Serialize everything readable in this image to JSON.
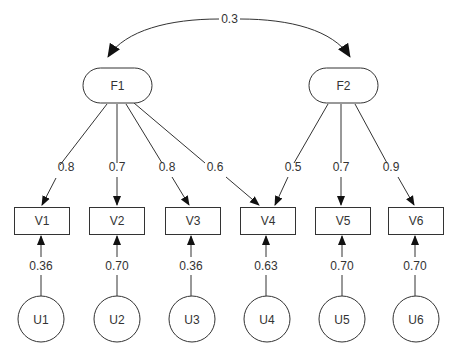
{
  "diagram": {
    "type": "structural-equation-model",
    "factors": [
      {
        "id": "F1",
        "label": "F1"
      },
      {
        "id": "F2",
        "label": "F2"
      }
    ],
    "factor_correlation": {
      "from": "F1",
      "to": "F2",
      "label": "0.3"
    },
    "variables": [
      {
        "id": "V1",
        "label": "V1"
      },
      {
        "id": "V2",
        "label": "V2"
      },
      {
        "id": "V3",
        "label": "V3"
      },
      {
        "id": "V4",
        "label": "V4"
      },
      {
        "id": "V5",
        "label": "V5"
      },
      {
        "id": "V6",
        "label": "V6"
      }
    ],
    "loadings": [
      {
        "from": "F1",
        "to": "V1",
        "label": "0.8"
      },
      {
        "from": "F1",
        "to": "V2",
        "label": "0.7"
      },
      {
        "from": "F1",
        "to": "V3",
        "label": "0.8"
      },
      {
        "from": "F1",
        "to": "V4",
        "label": "0.6"
      },
      {
        "from": "F2",
        "to": "V4",
        "label": "0.5"
      },
      {
        "from": "F2",
        "to": "V5",
        "label": "0.7"
      },
      {
        "from": "F2",
        "to": "V6",
        "label": "0.9"
      }
    ],
    "uniquenesses": [
      {
        "id": "U1",
        "label": "U1",
        "to": "V1",
        "value": "0.36"
      },
      {
        "id": "U2",
        "label": "U2",
        "to": "V2",
        "value": "0.70"
      },
      {
        "id": "U3",
        "label": "U3",
        "to": "V3",
        "value": "0.36"
      },
      {
        "id": "U4",
        "label": "U4",
        "to": "V4",
        "value": "0.63"
      },
      {
        "id": "U5",
        "label": "U5",
        "to": "V5",
        "value": "0.70"
      },
      {
        "id": "U6",
        "label": "U6",
        "to": "V6",
        "value": "0.70"
      }
    ]
  }
}
